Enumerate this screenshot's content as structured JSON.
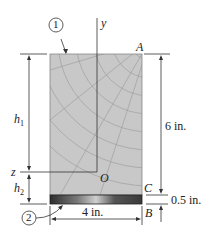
{
  "diagram": {
    "members": [
      {
        "id": "1",
        "label": "1",
        "material": "wood"
      },
      {
        "id": "2",
        "label": "2",
        "material": "steel"
      }
    ],
    "axes": {
      "y": "y",
      "z": "z",
      "origin": "O"
    },
    "points": {
      "A": "A",
      "B": "B",
      "C": "C"
    },
    "dimensions": {
      "height_total": "6 in.",
      "plate_thickness": "0.5 in.",
      "width": "4 in.",
      "h1": "h",
      "h1_sub": "1",
      "h2": "h",
      "h2_sub": "2"
    },
    "colors": {
      "wood": "#c9c9c9",
      "steel_dark": "#3a3a3a",
      "line": "#333333"
    }
  }
}
